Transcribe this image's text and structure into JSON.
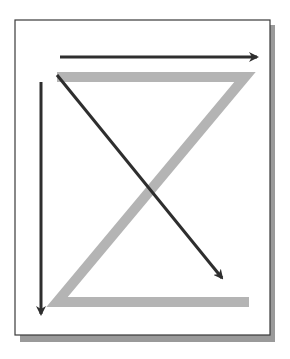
{
  "diagram": {
    "colors": {
      "background": "#ffffff",
      "frame_stroke": "#3a3a3a",
      "frame_shadow": "#9a9a9a",
      "z_path": "#b4b4b4",
      "arrow": "#2e2e2e"
    },
    "elements": [
      {
        "id": "z-shape",
        "type": "path",
        "description": "Gray Z shape: top bar, diagonal, bottom bar"
      },
      {
        "id": "arrow-horizontal",
        "type": "arrow",
        "direction": "right"
      },
      {
        "id": "arrow-diagonal",
        "type": "arrow",
        "direction": "down-right"
      },
      {
        "id": "arrow-vertical",
        "type": "arrow",
        "direction": "down"
      }
    ]
  }
}
